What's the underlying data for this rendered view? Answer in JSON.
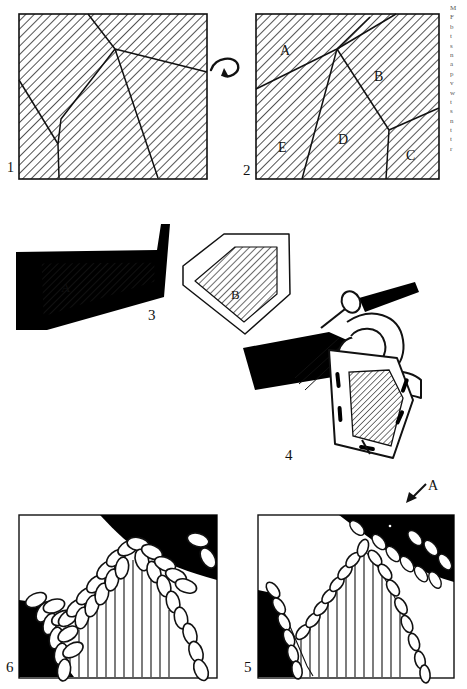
{
  "figure": {
    "kind": "multi-panel technical instruction illustration",
    "panel_count": 6,
    "hatching": "45-degree diagonal line fill",
    "panels": [
      {
        "number": "1",
        "number_position": "bottom-left outside",
        "type": "hatched-polygon-map",
        "description": "rectangular hatched field subdivided by irregular seam lines, unlabeled regions",
        "region_labels": []
      },
      {
        "number": "2",
        "number_position": "bottom-left outside",
        "type": "hatched-polygon-map",
        "description": "same rectangular hatched field as panel 1 with five lettered regions",
        "region_labels": [
          "A",
          "B",
          "C",
          "D",
          "E"
        ]
      },
      {
        "number": "3",
        "number_position": "right of black piece",
        "type": "cut-pieces",
        "description": "solid black surround with hatched triangular inset piece A, and an outlined pentagon with hatched piece B",
        "region_labels": [
          "A",
          "B"
        ]
      },
      {
        "number": "4",
        "number_position": "below assembly",
        "type": "tool-in-use",
        "description": "hand holding a needle/awl stitching a black piece onto a hatched form",
        "region_labels": []
      },
      {
        "number": "5",
        "number_position": "bottom-left outside",
        "type": "stitch-detail",
        "description": "close-up of a sewn seam joining a black area to a hatched-ribbed area, with whip-stitch ovals along the edge",
        "region_labels": []
      },
      {
        "number": "6",
        "number_position": "bottom-left outside",
        "type": "stitch-detail",
        "description": "close-up of a sewn seam joining a black area to a ribbed area, with chain/braid stitch loops along the edge",
        "region_labels": []
      }
    ],
    "annotations": [
      {
        "id": "rotate-arrow",
        "glyph": "curved arrow",
        "text": "",
        "between": "panel 1 and panel 2",
        "meaning": "turn / flip over"
      },
      {
        "id": "callout-A",
        "glyph": "arrow",
        "text": "A",
        "near": "panel 5 top-right",
        "meaning": "detail A location"
      }
    ],
    "panel2_labels": {
      "A": "A",
      "B": "B",
      "C": "C",
      "D": "D",
      "E": "E"
    },
    "panel3_labels": {
      "A": "A",
      "B": "B"
    },
    "numbers": {
      "p1": "1",
      "p2": "2",
      "p3": "3",
      "p4": "4",
      "p5": "5",
      "p6": "6"
    },
    "colors": {
      "ink": "#111111",
      "paper": "#ffffff",
      "solid_fill": "#000000",
      "hatch_line": "#1a1a1a"
    }
  },
  "margin_column": {
    "note": "cropped right-hand text column, letters clipped and unreadable",
    "lines": [
      "M",
      "F",
      "b",
      "t",
      "s",
      "n",
      "a",
      "p",
      "v",
      "w",
      "t",
      "s",
      "n",
      "t",
      "t",
      "r"
    ]
  }
}
